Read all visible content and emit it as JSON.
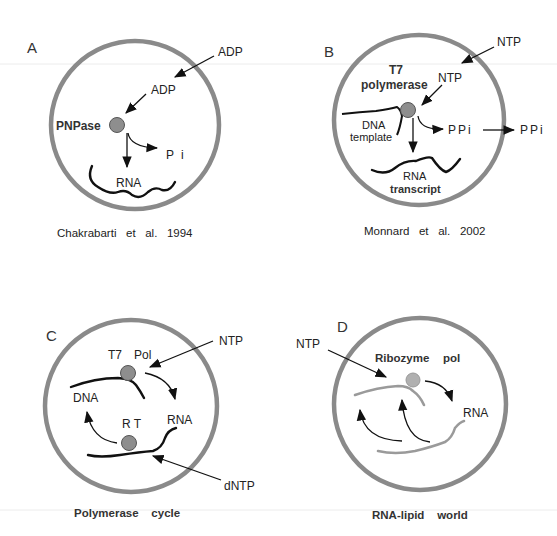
{
  "figure": {
    "panels": [
      {
        "id": "A",
        "letter": "A",
        "caption": "Chakrabarti   et   al.   1994",
        "labels": {
          "adp_outside": "ADP",
          "adp_inside": "ADP",
          "enzyme": "PNPase",
          "byproduct": "P i",
          "product": "RNA"
        }
      },
      {
        "id": "B",
        "letter": "B",
        "caption": "Monnard   et   al.   2002",
        "labels": {
          "ntp_outside": "NTP",
          "ntp_inside": "NTP",
          "enzyme_line1": "T7",
          "enzyme_line2": "polymerase",
          "template_line1": "DNA",
          "template_line2": "template",
          "byproduct_inside": "PPi",
          "byproduct_outside": "PPi",
          "product_line1": "RNA",
          "product_line2": "transcript"
        }
      },
      {
        "id": "C",
        "letter": "C",
        "caption": "Polymerase    cycle",
        "labels": {
          "ntp": "NTP",
          "enzyme_top_1": "T7",
          "enzyme_top_2": "Pol",
          "dna": "DNA",
          "rna": "RNA",
          "enzyme_bottom": "R T",
          "dntp": "dNTP"
        }
      },
      {
        "id": "D",
        "letter": "D",
        "caption": "RNA-lipid    world",
        "labels": {
          "ntp": "NTP",
          "enzyme_1": "Ribozyme",
          "enzyme_2": "pol",
          "rna": "RNA"
        }
      }
    ],
    "colors": {
      "membrane": "#8a8a8a",
      "enzyme": "#8e8e8e",
      "strand": "#111111",
      "ribozyme_strand": "#9a9a9a"
    }
  }
}
